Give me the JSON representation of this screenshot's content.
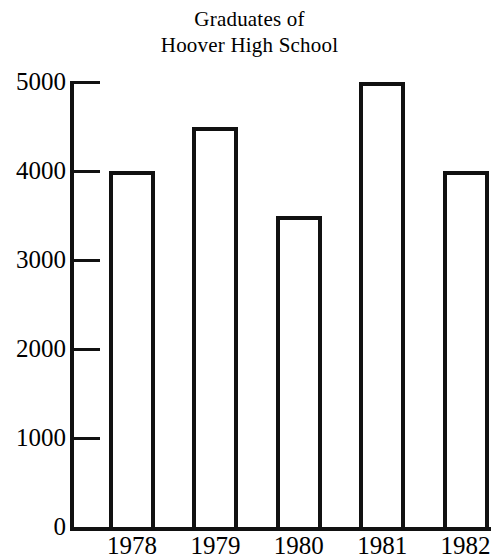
{
  "chart_data": {
    "type": "bar",
    "title": "Graduates of Hoover High School",
    "title_lines": [
      "Graduates of",
      "Hoover High School"
    ],
    "categories": [
      "1978",
      "1979",
      "1980",
      "1981",
      "1982"
    ],
    "values": [
      4000,
      4500,
      3500,
      5000,
      4000
    ],
    "xlabel": "",
    "ylabel": "",
    "ylim": [
      0,
      5000
    ],
    "ytick_labels": [
      "0",
      "1000",
      "2000",
      "3000",
      "4000",
      "5000"
    ],
    "ytick_values": [
      0,
      1000,
      2000,
      3000,
      4000,
      5000
    ],
    "grid": false,
    "legend": false,
    "bar_style": {
      "fill": "#ffffff",
      "outline": "#111111",
      "outline_width_px": 4
    }
  }
}
